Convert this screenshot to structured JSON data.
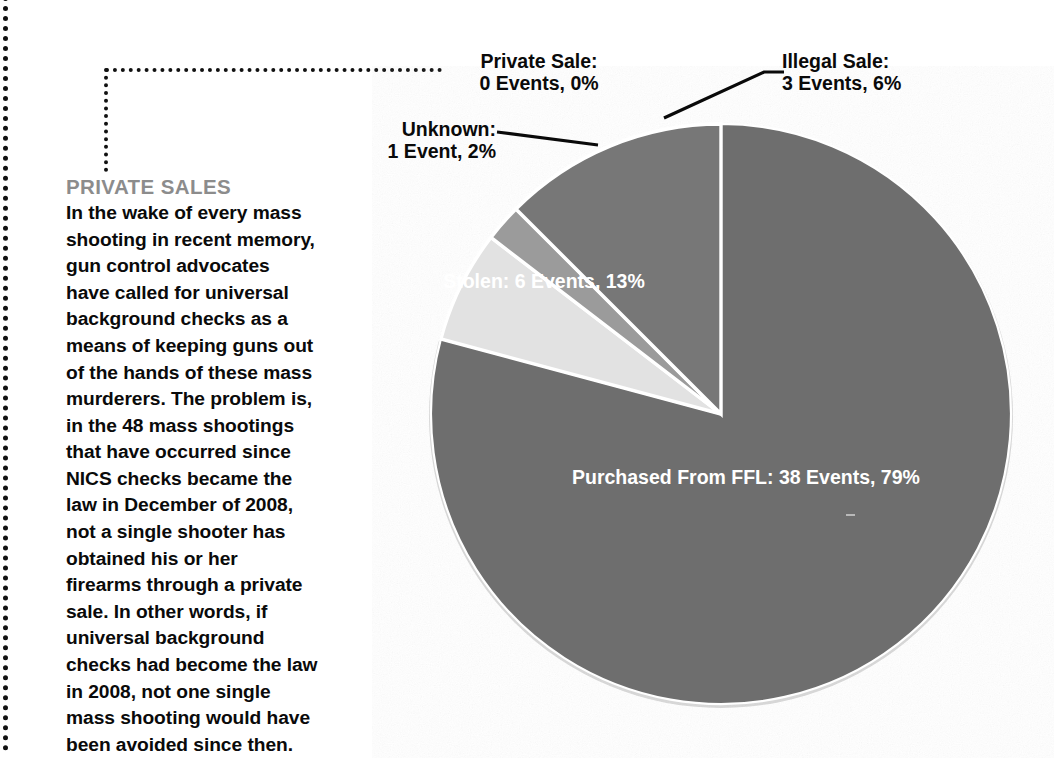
{
  "chart_data": {
    "type": "pie",
    "title": "",
    "total_events": 48,
    "legend_position": "callouts",
    "grid": false,
    "start_angle_deg": 0,
    "direction": "clockwise",
    "categories": [
      "Purchased From FFL",
      "Illegal Sale",
      "Unknown",
      "Stolen",
      "Private Sale"
    ],
    "values": [
      38,
      3,
      1,
      6,
      0
    ],
    "percents": [
      79,
      6,
      2,
      13,
      0
    ],
    "colors": [
      "#6e6e6e",
      "#e2e2e2",
      "#9b9b9b",
      "#777777",
      "#ffffff"
    ],
    "slices": [
      {
        "name": "Purchased From FFL",
        "events": 38,
        "percent": 79,
        "color": "#6e6e6e",
        "label_line1": "Purchased From FFL:",
        "label_line2": "38 Events, 79%",
        "label_placement": "inside"
      },
      {
        "name": "Illegal Sale",
        "events": 3,
        "percent": 6,
        "color": "#e2e2e2",
        "label_line1": "Illegal Sale:",
        "label_line2": "3 Events, 6%",
        "label_placement": "callout"
      },
      {
        "name": "Unknown",
        "events": 1,
        "percent": 2,
        "color": "#9b9b9b",
        "label_line1": "Unknown:",
        "label_line2": "1 Event, 2%",
        "label_placement": "callout"
      },
      {
        "name": "Stolen",
        "events": 6,
        "percent": 13,
        "color": "#777777",
        "label_line1": "Stolen:",
        "label_line2": "6 Events, 13%",
        "label_placement": "inside"
      },
      {
        "name": "Private Sale",
        "events": 0,
        "percent": 0,
        "color": "#ffffff",
        "label_line1": "Private Sale:",
        "label_line2": "0 Events, 0%",
        "label_placement": "callout-dotted"
      }
    ]
  },
  "callouts": {
    "private_sale": {
      "line1": "Private Sale:",
      "line2": "0 Events, 0%"
    },
    "illegal_sale": {
      "line1": "Illegal Sale:",
      "line2": "3 Events, 6%"
    },
    "unknown": {
      "line1": "Unknown:",
      "line2": "1 Event, 2%"
    }
  },
  "slice_labels": {
    "stolen": {
      "line1": "Stolen:",
      "line2": "6 Events, 13%"
    },
    "ffl": {
      "line1": "Purchased From FFL:",
      "line2": "38 Events, 79%"
    }
  },
  "copy": {
    "heading": "PRIVATE SALES",
    "body": "In the wake of every mass shooting in recent memory, gun control advocates have called for universal background checks as a means of keeping guns out of the hands of these mass murderers. The problem is, in the 48 mass shootings that have occurred since NICS checks became the law in December of 2008, not a single shooter has obtained his or her firearms through a private sale. In other words, if universal background checks had become the law in 2008, not one single mass shooting would have been avoided since then."
  },
  "colors": {
    "heading_gray": "#8c8c8c",
    "text_black": "#0a0a0a",
    "slice_ffl": "#6e6e6e",
    "slice_stolen": "#777777",
    "slice_unknown": "#9b9b9b",
    "slice_illegal": "#e2e2e2",
    "background": "#ffffff"
  }
}
